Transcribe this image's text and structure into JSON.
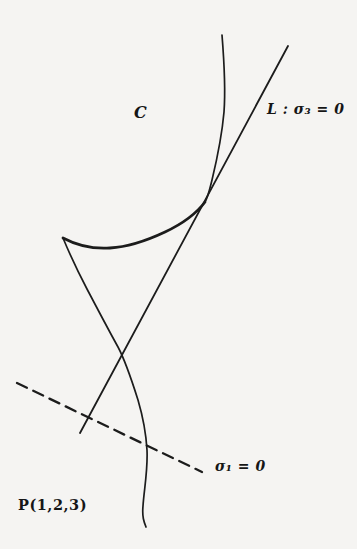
{
  "figure": {
    "background_color": "#f5f4f2",
    "ink_color": "#1c1c1c",
    "labels": {
      "curve": "C",
      "tangent_line": "L : σ₃ = 0",
      "dashed_line": "σ₁ = 0",
      "point": "P(1,2,3)"
    },
    "geometry": {
      "curve_top_branch": "M 222,35 C 224,60 226,85 224,112 C 222,135 218,155 212,180 C 209,192 208,197 205,202",
      "curve_bold_arc": "M 205,202 C 196,214 182,224 165,232 C 148,240 128,247 110,248 C 95,249 78,246 63,238",
      "curve_lower_branch": "M 63,238 C 68,250 76,268 87,289 C 97,308 108,329 118,347 C 126,362 132,381 138,400 C 143,417 146,433 147,450 C 148,470 144,490 143,506 C 142,517 144,522 146,527",
      "tangent_line_path": "M 288,46 L 80,433",
      "dashed_line_path": "M 17,383 L 202,472"
    }
  }
}
